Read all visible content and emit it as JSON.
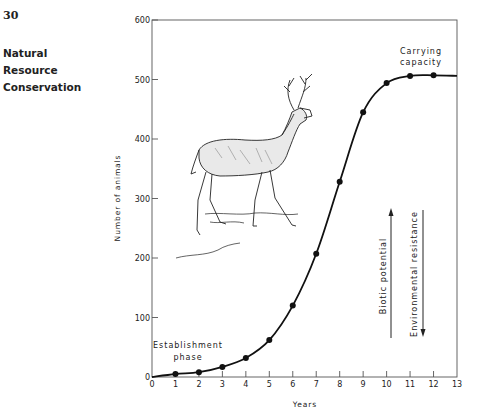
{
  "page": {
    "page_number": "30",
    "running_head": [
      "Natural",
      "Resource",
      "Conservation"
    ]
  },
  "chart_data": {
    "type": "line",
    "title": "",
    "xlabel": "Years",
    "ylabel": "Number of animals",
    "x": [
      0,
      1,
      2,
      3,
      4,
      5,
      6,
      7,
      8,
      9,
      10,
      11,
      12
    ],
    "series": [
      {
        "name": "Deer population",
        "values": [
          0,
          5,
          8,
          17,
          32,
          62,
          120,
          207,
          328,
          445,
          494,
          506,
          507
        ],
        "markers": [
          false,
          true,
          true,
          true,
          true,
          true,
          true,
          true,
          true,
          true,
          true,
          true,
          true
        ]
      }
    ],
    "curve_end": {
      "x": 13,
      "y": 506
    },
    "xlim": [
      0,
      13
    ],
    "ylim": [
      0,
      600
    ],
    "xticks": [
      0,
      1,
      2,
      3,
      4,
      5,
      6,
      7,
      8,
      9,
      10,
      11,
      12,
      13
    ],
    "yticks": [
      0,
      100,
      200,
      300,
      400,
      500,
      600
    ],
    "grid": false,
    "annotations": {
      "establishment": [
        "Establishment",
        "phase"
      ],
      "carrying": [
        "Carrying",
        "capacity"
      ],
      "biotic": "Biotic potential",
      "environmental": "Environmental resistance"
    },
    "illustration": "white-tailed deer (buck) drawing"
  }
}
